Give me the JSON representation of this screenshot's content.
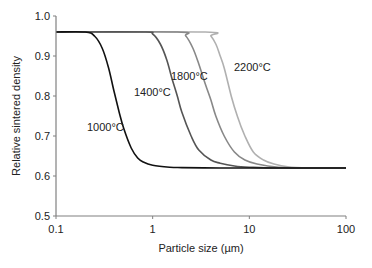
{
  "chart_data": {
    "type": "line",
    "title": "",
    "xlabel": "Particle size (µm)",
    "ylabel": "Relative sintered density",
    "xscale": "log",
    "xlim": [
      0.1,
      100
    ],
    "ylim": [
      0.5,
      1.0
    ],
    "xticks": [
      0.1,
      1,
      10,
      100
    ],
    "xtick_labels": [
      "0.1",
      "1",
      "10",
      "100"
    ],
    "yticks": [
      0.5,
      0.6,
      0.7,
      0.8,
      0.9,
      1.0
    ],
    "ytick_labels": [
      "0.5",
      "0.6",
      "0.7",
      "0.8",
      "0.9",
      "1.0"
    ],
    "grid": false,
    "legend": "none (inline curve labels)",
    "series": [
      {
        "name": "1000°C",
        "label": "1000°C",
        "color": "#111111",
        "x": [
          0.1,
          0.2,
          0.25,
          0.3,
          0.35,
          0.4,
          0.45,
          0.5,
          0.6,
          0.7,
          0.8,
          1,
          1.5,
          2,
          5,
          10,
          100
        ],
        "y": [
          0.96,
          0.96,
          0.95,
          0.92,
          0.87,
          0.81,
          0.76,
          0.72,
          0.67,
          0.645,
          0.635,
          0.627,
          0.622,
          0.621,
          0.62,
          0.62,
          0.62
        ]
      },
      {
        "name": "1400°C",
        "label": "1400°C",
        "color": "#555555",
        "x": [
          0.1,
          0.8,
          1.0,
          1.2,
          1.4,
          1.6,
          1.8,
          2.0,
          2.5,
          3.0,
          4.0,
          5.0,
          7,
          10,
          20,
          100
        ],
        "y": [
          0.96,
          0.96,
          0.955,
          0.93,
          0.89,
          0.84,
          0.8,
          0.76,
          0.7,
          0.665,
          0.64,
          0.632,
          0.625,
          0.622,
          0.62,
          0.62
        ]
      },
      {
        "name": "1800°C",
        "label": "1800°C",
        "color": "#888888",
        "x": [
          0.1,
          1.8,
          2.2,
          2.6,
          3.0,
          3.5,
          4.0,
          4.5,
          5.5,
          7,
          9,
          12,
          20,
          40,
          100
        ],
        "y": [
          0.96,
          0.96,
          0.95,
          0.92,
          0.88,
          0.83,
          0.79,
          0.75,
          0.7,
          0.66,
          0.64,
          0.63,
          0.622,
          0.62,
          0.62
        ]
      },
      {
        "name": "2200°C",
        "label": "2200°C",
        "color": "#b0b0b0",
        "x": [
          0.1,
          3.5,
          4.0,
          4.5,
          5.0,
          5.5,
          6.5,
          7.5,
          9,
          11,
          14,
          18,
          25,
          40,
          100
        ],
        "y": [
          0.96,
          0.96,
          0.95,
          0.93,
          0.9,
          0.87,
          0.8,
          0.75,
          0.7,
          0.66,
          0.64,
          0.63,
          0.623,
          0.62,
          0.62
        ]
      }
    ],
    "annotations": [
      {
        "text": "1000°C",
        "x_px": 87,
        "y_px": 131
      },
      {
        "text": "1400°C",
        "x_px": 134,
        "y_px": 96
      },
      {
        "text": "1800°C",
        "x_px": 171,
        "y_px": 80
      },
      {
        "text": "2200°C",
        "x_px": 234,
        "y_px": 71
      }
    ]
  }
}
